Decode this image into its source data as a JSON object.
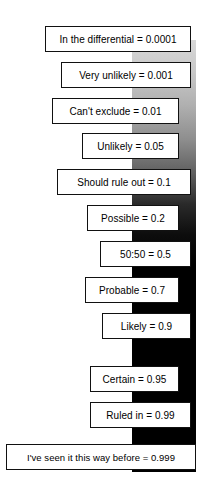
{
  "figure": {
    "type": "ladder-diagram",
    "background_color": "#ffffff",
    "box_border_color": "#111111",
    "box_fill_color": "#ffffff",
    "bar": {
      "name": "probability-gradient-bar",
      "top_color": "#d8d8d8",
      "bottom_color": "#000000",
      "description": "vertical gradient from light gray at top to solid black at bottom"
    }
  },
  "rungs": [
    {
      "label": "In the differential = 0.0001",
      "phrase": "In the differential",
      "value": 0.0001,
      "left": 45,
      "width": 146,
      "top": 26
    },
    {
      "label": "Very unlikely = 0.001",
      "phrase": "Very unlikely",
      "value": 0.001,
      "left": 61,
      "width": 130,
      "top": 62
    },
    {
      "label": "Can't exclude = 0.01",
      "phrase": "Can't exclude",
      "value": 0.01,
      "left": 52,
      "width": 127,
      "top": 98
    },
    {
      "label": "Unlikely = 0.05",
      "phrase": "Unlikely",
      "value": 0.05,
      "left": 82,
      "width": 97,
      "top": 133
    },
    {
      "label": "Should rule out = 0.1",
      "phrase": "Should rule out",
      "value": 0.1,
      "left": 57,
      "width": 134,
      "top": 169
    },
    {
      "label": "Possible = 0.2",
      "phrase": "Possible",
      "value": 0.2,
      "left": 87,
      "width": 92,
      "top": 205
    },
    {
      "label": "50:50 = 0.5",
      "phrase": "50:50",
      "value": 0.5,
      "left": 100,
      "width": 91,
      "top": 241
    },
    {
      "label": "Probable = 0.7",
      "phrase": "Probable",
      "value": 0.7,
      "left": 85,
      "width": 94,
      "top": 277
    },
    {
      "label": "Likely = 0.9",
      "phrase": "Likely",
      "value": 0.9,
      "left": 102,
      "width": 89,
      "top": 313
    },
    {
      "label": "Certain = 0.95",
      "phrase": "Certain",
      "value": 0.95,
      "left": 90,
      "width": 89,
      "top": 366
    },
    {
      "label": "Ruled in = 0.99",
      "phrase": "Ruled in",
      "value": 0.99,
      "left": 90,
      "width": 101,
      "top": 402
    },
    {
      "label": "I've seen it this way before = 0.999",
      "phrase": "I've seen it this way before",
      "value": 0.999,
      "left": 6,
      "width": 190,
      "top": 444
    }
  ]
}
